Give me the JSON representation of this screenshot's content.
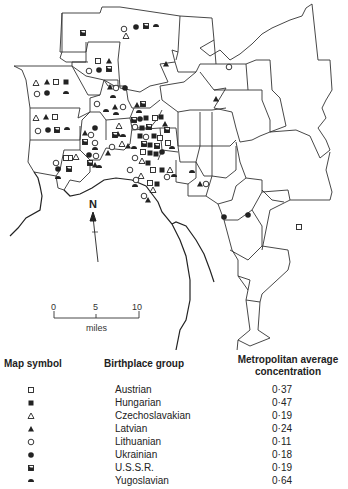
{
  "map": {
    "north_label": "N",
    "scale": {
      "ticks": [
        "0",
        "5",
        "10"
      ],
      "unit": "miles"
    }
  },
  "legend": {
    "headers": {
      "symbol": "Map symbol",
      "group": "Birthplace group",
      "concentration": "Metropolitan average concentration"
    },
    "rows": [
      {
        "symbol": "open-square",
        "group": "Austrian",
        "value": "0·37"
      },
      {
        "symbol": "filled-square",
        "group": "Hungarian",
        "value": "0·47"
      },
      {
        "symbol": "open-triangle",
        "group": "Czechoslavakian",
        "value": "0·19"
      },
      {
        "symbol": "filled-triangle",
        "group": "Latvian",
        "value": "0·24"
      },
      {
        "symbol": "open-circle",
        "group": "Lithuanian",
        "value": "0·11"
      },
      {
        "symbol": "filled-circle",
        "group": "Ukrainian",
        "value": "0·18"
      },
      {
        "symbol": "half-filled-square",
        "group": "U.S.S.R.",
        "value": "0·19"
      },
      {
        "symbol": "half-disc",
        "group": "Yugoslavian",
        "value": "0·64"
      }
    ]
  }
}
